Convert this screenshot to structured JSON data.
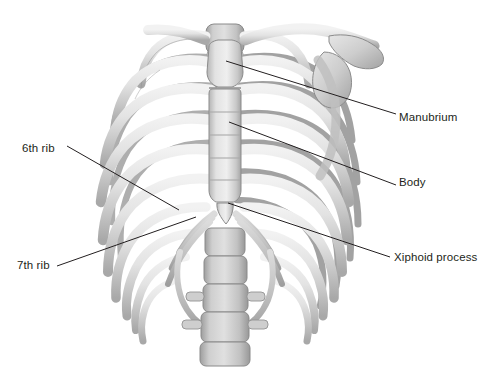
{
  "figure": {
    "background_color": "#ffffff",
    "line_color": "#231f20",
    "text_color": "#231f20"
  },
  "labels": {
    "manubrium": "Manubrium",
    "body": "Body",
    "xiphoid_process": "Xiphoid process",
    "rib_6": "6th rib",
    "rib_7": "7th rib"
  },
  "leader_lines": [
    {
      "name": "manubrium",
      "from": [
        226,
        61
      ],
      "to": [
        396,
        114
      ]
    },
    {
      "name": "body",
      "from": [
        229,
        122
      ],
      "to": [
        396,
        185
      ]
    },
    {
      "name": "xiphoid-process",
      "from": [
        228,
        203
      ],
      "to": [
        390,
        257
      ]
    },
    {
      "name": "rib-6",
      "from": [
        67,
        146
      ],
      "to": [
        179,
        210
      ]
    },
    {
      "name": "rib-7",
      "from": [
        57,
        266
      ],
      "to": [
        196,
        217
      ]
    }
  ],
  "palette": {
    "bone_light": "#e9e9e9",
    "bone_mid": "#d2d2d2",
    "bone_shadow": "#a9a9a9",
    "bone_dark": "#8e8e8e",
    "cartilage": "#c4c4c4",
    "outline": "#7d7d7d"
  },
  "structures": [
    "manubrium",
    "sternal body",
    "xiphoid process",
    "clavicle",
    "scapula",
    "ribs 1-10",
    "costal cartilage",
    "thoracic vertebrae",
    "lumbar vertebrae"
  ]
}
